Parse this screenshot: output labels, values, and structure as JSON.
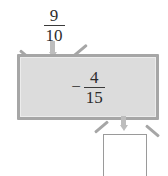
{
  "diagram": {
    "type": "function-machine",
    "input": {
      "label": "9/10",
      "numerator": "9",
      "denominator": "10",
      "sign": ""
    },
    "operation": {
      "label": "-4/15",
      "sign": "−",
      "numerator": "4",
      "denominator": "15"
    },
    "output": {
      "label": "",
      "value": "",
      "empty": true
    },
    "arrows": {
      "input_arrow": "arrow-down",
      "output_arrow": "arrow-down"
    },
    "colors": {
      "box_fill": "#dcdcdc",
      "box_border": "#a6a6a6",
      "arrow": "#bdbdbd",
      "text": "#2b2b2b",
      "output_box_border": "#9a9a9a",
      "output_box_fill": "#ffffff",
      "background": "#ffffff"
    }
  }
}
